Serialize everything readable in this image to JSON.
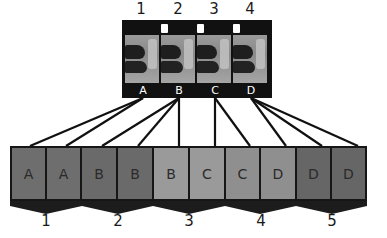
{
  "diagram": {
    "title": "",
    "film_strip": {
      "frame_numbers": [
        "1",
        "2",
        "3",
        "4"
      ],
      "frame_letters": [
        "A",
        "B",
        "C",
        "D"
      ]
    },
    "output_boxes": [
      {
        "label": "A",
        "color": "#6e6e6e",
        "source": "A"
      },
      {
        "label": "A",
        "color": "#6e6e6e",
        "source": "A"
      },
      {
        "label": "B",
        "color": "#6a6a6a",
        "source": "B"
      },
      {
        "label": "B",
        "color": "#6a6a6a",
        "source": "B"
      },
      {
        "label": "B",
        "color": "#9a9a9a",
        "source": "B"
      },
      {
        "label": "C",
        "color": "#9a9a9a",
        "source": "C"
      },
      {
        "label": "C",
        "color": "#8f8f8f",
        "source": "C"
      },
      {
        "label": "D",
        "color": "#8f8f8f",
        "source": "D"
      },
      {
        "label": "D",
        "color": "#666666",
        "source": "D"
      },
      {
        "label": "D",
        "color": "#666666",
        "source": "D"
      }
    ],
    "group_numbers": [
      "1",
      "2",
      "3",
      "4",
      "5"
    ],
    "edges": [
      {
        "from": "A",
        "to": 0
      },
      {
        "from": "A",
        "to": 1
      },
      {
        "from": "B",
        "to": 2
      },
      {
        "from": "B",
        "to": 3
      },
      {
        "from": "B",
        "to": 4
      },
      {
        "from": "C",
        "to": 5
      },
      {
        "from": "C",
        "to": 6
      },
      {
        "from": "D",
        "to": 7
      },
      {
        "from": "D",
        "to": 8
      },
      {
        "from": "D",
        "to": 9
      }
    ],
    "colors": {
      "line": "#111111",
      "strip": "#111111",
      "box_border": "#161616",
      "chevron": "#1c1c1c"
    }
  }
}
